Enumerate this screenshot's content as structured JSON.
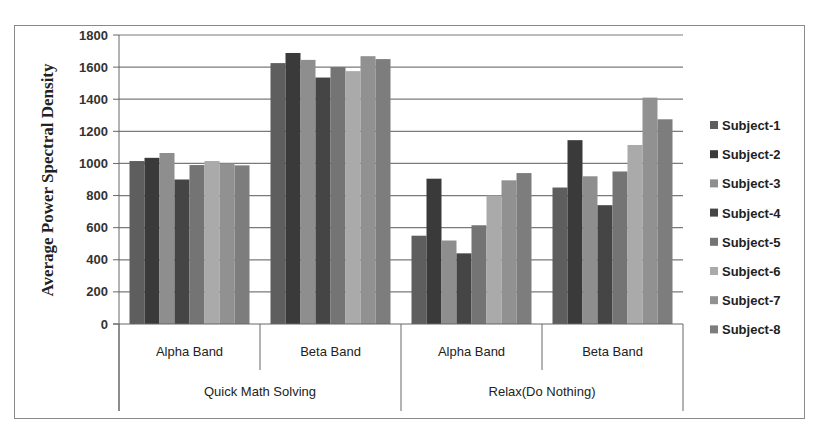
{
  "chart_data": {
    "type": "bar",
    "title": "",
    "xlabel": "",
    "ylabel": "Average Power Spectral Density",
    "ylim": [
      0,
      1800
    ],
    "yticks": [
      0,
      200,
      400,
      600,
      800,
      1000,
      1200,
      1400,
      1600,
      1800
    ],
    "grid": true,
    "legend_position": "right",
    "categories": [
      {
        "label": "Alpha Band",
        "group": "Quick Math Solving"
      },
      {
        "label": "Beta Band",
        "group": "Quick Math Solving"
      },
      {
        "label": "Alpha Band",
        "group": "Relax(Do Nothing)"
      },
      {
        "label": "Beta Band",
        "group": "Relax(Do Nothing)"
      }
    ],
    "groups": [
      "Quick Math Solving",
      "Relax(Do Nothing)"
    ],
    "series": [
      {
        "name": "Subject-1",
        "color": "#5e5e5e",
        "values": [
          1015,
          1625,
          550,
          850
        ]
      },
      {
        "name": "Subject-2",
        "color": "#3a3a3a",
        "values": [
          1035,
          1688,
          905,
          1145
        ]
      },
      {
        "name": "Subject-3",
        "color": "#8e8e8e",
        "values": [
          1065,
          1645,
          520,
          920
        ]
      },
      {
        "name": "Subject-4",
        "color": "#454545",
        "values": [
          900,
          1535,
          440,
          740
        ]
      },
      {
        "name": "Subject-5",
        "color": "#747474",
        "values": [
          990,
          1600,
          615,
          950
        ]
      },
      {
        "name": "Subject-6",
        "color": "#aaaaaa",
        "values": [
          1015,
          1575,
          800,
          1115
        ]
      },
      {
        "name": "Subject-7",
        "color": "#919191",
        "values": [
          1000,
          1668,
          895,
          1410
        ]
      },
      {
        "name": "Subject-8",
        "color": "#7d7d7d",
        "values": [
          988,
          1650,
          940,
          1275
        ]
      }
    ]
  }
}
